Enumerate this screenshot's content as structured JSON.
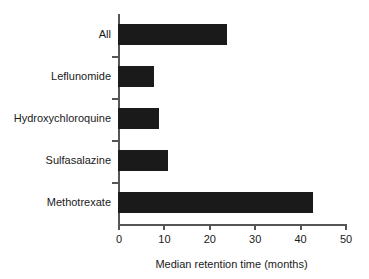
{
  "chart_data": {
    "type": "bar",
    "orientation": "horizontal",
    "title": "",
    "xlabel": "Median retention time (months)",
    "ylabel": "",
    "categories": [
      "All",
      "Leflunomide",
      "Hydroxychloroquine",
      "Sulfasalazine",
      "Methotrexate"
    ],
    "values": [
      24,
      8,
      9,
      11,
      43
    ],
    "xlim": [
      0,
      50
    ],
    "xticks": [
      0,
      10,
      20,
      30,
      40,
      50
    ],
    "xtick_labels": [
      "0",
      "10",
      "20",
      "30",
      "40",
      "50"
    ],
    "grid": false,
    "legend": null,
    "bar_color": "#1a1a1a",
    "axis_color": "#555555",
    "background_color": "#ffffff"
  }
}
